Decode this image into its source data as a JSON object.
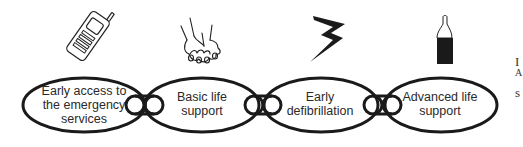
{
  "diagram": {
    "type": "chain-of-survival",
    "links": [
      {
        "id": "early-access",
        "lines": [
          "Early access to",
          "the emergency",
          "services"
        ],
        "icon": "mobile-phone-icon"
      },
      {
        "id": "basic-life-support",
        "lines": [
          "Basic life",
          "support"
        ],
        "icon": "clasped-hands-icon"
      },
      {
        "id": "early-defibrillation",
        "lines": [
          "Early",
          "defibrillation"
        ],
        "icon": "lightning-bolt-icon"
      },
      {
        "id": "advanced-life-support",
        "lines": [
          "Advanced life",
          "support"
        ],
        "icon": "medicine-vial-icon"
      }
    ],
    "edge_text": [
      "I",
      "A",
      "s"
    ],
    "colors": {
      "stroke": "#1a1a1a",
      "text": "#2a2a2a",
      "background": "#ffffff"
    }
  }
}
